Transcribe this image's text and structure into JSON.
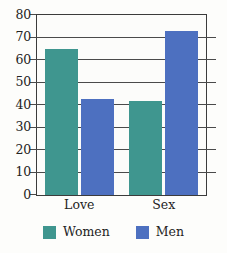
{
  "chart_data": {
    "type": "bar",
    "title": "",
    "subtitle": "",
    "xlabel": "",
    "ylabel": "",
    "categories": [
      "Love",
      "Sex"
    ],
    "series": [
      {
        "name": "Women",
        "color": "#3f968f",
        "values": [
          65,
          42
        ]
      },
      {
        "name": "Men",
        "color": "#4d70c0",
        "values": [
          42.5,
          73
        ]
      }
    ],
    "ylim": [
      0,
      80
    ],
    "ytick_step": 10,
    "ytick_labels": [
      "0",
      "10",
      "20",
      "30",
      "40",
      "50",
      "60",
      "70",
      "80"
    ],
    "grid": true,
    "legend_position": "bottom"
  },
  "legend": {
    "entries": [
      {
        "label": "Women",
        "color": "#3f968f"
      },
      {
        "label": "Men",
        "color": "#4d70c0"
      }
    ]
  },
  "axis": {
    "y_labels": [
      "80",
      "70",
      "60",
      "50",
      "40",
      "30",
      "20",
      "10",
      "0"
    ],
    "x_labels": [
      "Love",
      "Sex"
    ]
  },
  "colors": {
    "women": "#3f968f",
    "men": "#4d70c0",
    "axis": "#3b3b3b",
    "grid": "#4a4a4a",
    "background": "#fdfdfb",
    "text": "#232323"
  }
}
